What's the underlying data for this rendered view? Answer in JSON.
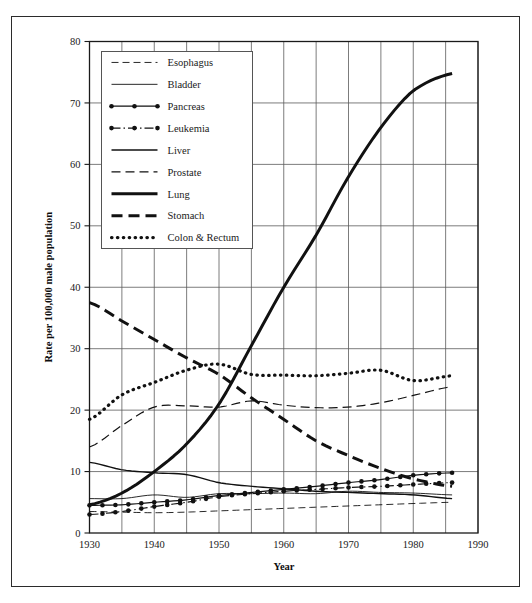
{
  "chart_data": {
    "type": "line",
    "title": "",
    "xlabel": "Year",
    "ylabel": "Rate per 100,000 male population",
    "xlim": [
      1930,
      1990
    ],
    "ylim": [
      0,
      80
    ],
    "x_ticks": [
      1930,
      1940,
      1950,
      1960,
      1970,
      1980,
      1990
    ],
    "x_gridlines": [
      1930,
      1935,
      1940,
      1945,
      1950,
      1955,
      1960,
      1965,
      1970,
      1975,
      1980,
      1985,
      1990
    ],
    "y_ticks": [
      0,
      10,
      20,
      30,
      40,
      50,
      60,
      70,
      80
    ],
    "grid": true,
    "legend_position": "upper-left-inside",
    "series": [
      {
        "name": "Esophagus",
        "style": "dashed-thin",
        "x": [
          1930,
          1935,
          1940,
          1945,
          1950,
          1955,
          1960,
          1965,
          1970,
          1975,
          1980,
          1986
        ],
        "values": [
          3.5,
          3.4,
          3.3,
          3.4,
          3.6,
          3.8,
          4.0,
          4.2,
          4.4,
          4.6,
          4.8,
          5.0
        ]
      },
      {
        "name": "Bladder",
        "style": "solid-thin",
        "x": [
          1930,
          1935,
          1940,
          1945,
          1950,
          1955,
          1960,
          1965,
          1970,
          1975,
          1980,
          1986
        ],
        "values": [
          5.6,
          5.6,
          6.2,
          5.8,
          6.4,
          6.4,
          6.5,
          6.4,
          6.8,
          6.6,
          6.5,
          6.2
        ]
      },
      {
        "name": "Pancreas",
        "style": "solid-marker",
        "x": [
          1930,
          1935,
          1940,
          1945,
          1950,
          1955,
          1960,
          1965,
          1970,
          1975,
          1980,
          1986
        ],
        "values": [
          4.5,
          4.6,
          5.0,
          5.4,
          6.1,
          6.6,
          7.1,
          7.6,
          8.2,
          8.7,
          9.4,
          9.8
        ]
      },
      {
        "name": "Leukemia",
        "style": "dash-dot-marker",
        "x": [
          1930,
          1935,
          1940,
          1945,
          1950,
          1955,
          1960,
          1965,
          1970,
          1975,
          1980,
          1986
        ],
        "values": [
          3.0,
          3.5,
          4.3,
          5.0,
          5.9,
          6.4,
          6.8,
          7.1,
          7.4,
          7.6,
          7.9,
          8.2
        ]
      },
      {
        "name": "Liver",
        "style": "solid-medium",
        "x": [
          1930,
          1935,
          1940,
          1945,
          1950,
          1955,
          1960,
          1965,
          1970,
          1975,
          1980,
          1986
        ],
        "values": [
          11.5,
          10.3,
          9.8,
          9.5,
          8.2,
          7.6,
          7.2,
          6.8,
          6.6,
          6.4,
          6.2,
          5.6
        ]
      },
      {
        "name": "Prostate",
        "style": "dashed-medium",
        "x": [
          1930,
          1935,
          1940,
          1945,
          1950,
          1955,
          1960,
          1965,
          1970,
          1975,
          1980,
          1986
        ],
        "values": [
          14.0,
          17.5,
          20.5,
          20.7,
          20.5,
          21.5,
          20.8,
          20.4,
          20.5,
          21.2,
          22.4,
          23.8
        ]
      },
      {
        "name": "Lung",
        "style": "solid-thick",
        "x": [
          1930,
          1935,
          1940,
          1945,
          1950,
          1955,
          1960,
          1965,
          1970,
          1975,
          1980,
          1986
        ],
        "values": [
          4.6,
          6.5,
          10.0,
          14.5,
          21.0,
          30.5,
          40.0,
          48.5,
          58.0,
          66.0,
          72.0,
          74.8
        ]
      },
      {
        "name": "Stomach",
        "style": "dashed-thick",
        "x": [
          1930,
          1935,
          1940,
          1945,
          1950,
          1955,
          1960,
          1965,
          1970,
          1975,
          1980,
          1986
        ],
        "values": [
          37.5,
          34.5,
          31.5,
          28.5,
          25.8,
          22.0,
          18.5,
          15.0,
          12.6,
          10.5,
          8.8,
          7.6
        ]
      },
      {
        "name": "Colon & Rectum",
        "style": "dotted-thick",
        "x": [
          1930,
          1935,
          1940,
          1945,
          1950,
          1955,
          1960,
          1965,
          1970,
          1975,
          1980,
          1986
        ],
        "values": [
          18.5,
          22.5,
          24.5,
          26.5,
          27.5,
          25.8,
          25.7,
          25.6,
          26.0,
          26.5,
          24.8,
          25.6
        ]
      }
    ]
  },
  "legend": {
    "items": [
      {
        "label": "Esophagus",
        "style": "dashed-thin"
      },
      {
        "label": "Bladder",
        "style": "solid-thin"
      },
      {
        "label": "Pancreas",
        "style": "solid-marker"
      },
      {
        "label": "Leukemia",
        "style": "dash-dot-marker"
      },
      {
        "label": "Liver",
        "style": "solid-medium"
      },
      {
        "label": "Prostate",
        "style": "dashed-medium"
      },
      {
        "label": "Lung",
        "style": "solid-thick"
      },
      {
        "label": "Stomach",
        "style": "dashed-thick"
      },
      {
        "label": "Colon & Rectum",
        "style": "dotted-thick"
      }
    ]
  },
  "colors": {
    "line": "#111111",
    "grid": "#5a5a5a",
    "frame": "#1a1a1a",
    "border": "#2b2b2b",
    "background": "#ffffff"
  }
}
